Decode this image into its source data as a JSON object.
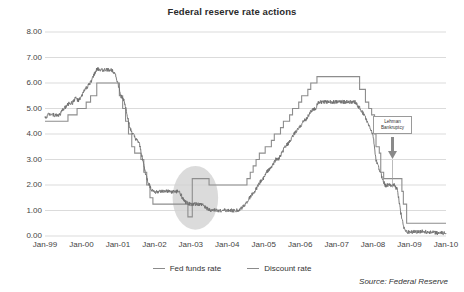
{
  "chart_data": {
    "type": "line",
    "title": "Federal reserve rate actions",
    "xlabel": "",
    "ylabel": "",
    "ylim": [
      0,
      8
    ],
    "ytick_step": 1.0,
    "ytick_labels": [
      "8.00",
      "7.00",
      "6.00",
      "5.00",
      "4.00",
      "3.00",
      "2.00",
      "1.00",
      "0.00"
    ],
    "ytick_values": [
      8,
      7,
      6,
      5,
      4,
      3,
      2,
      1,
      0
    ],
    "xtick_labels": [
      "Jan-99",
      "Jan-00",
      "Jan-01",
      "Jan-02",
      "Jan-03",
      "Jan-04",
      "Jan-05",
      "Jan-06",
      "Jan-07",
      "Jan-08",
      "Jan-09",
      "Jan-10"
    ],
    "xlim": [
      "Jan-99",
      "Jan-10"
    ],
    "grid": "horizontal",
    "legend_position": "bottom-center",
    "source": "Source: Federal Reserve",
    "annotations": [
      {
        "name": "lehman-bankruptcy",
        "line1": "Lehman",
        "line2": "Bankruptcy",
        "x": "Sep-08",
        "arrow": "down"
      }
    ],
    "highlight": {
      "name": "trough-ellipse",
      "x_range": [
        "Jul-02",
        "Oct-03"
      ],
      "y_range": [
        0.6,
        2.4
      ]
    },
    "series": [
      {
        "name": "Fed funds rate",
        "color": "#6f6f6f",
        "points": [
          [
            1999.0,
            4.63
          ],
          [
            1999.08,
            4.76
          ],
          [
            1999.17,
            4.81
          ],
          [
            1999.25,
            4.74
          ],
          [
            1999.33,
            4.74
          ],
          [
            1999.42,
            4.76
          ],
          [
            1999.5,
            4.99
          ],
          [
            1999.58,
            5.07
          ],
          [
            1999.67,
            5.22
          ],
          [
            1999.75,
            5.2
          ],
          [
            1999.83,
            5.42
          ],
          [
            1999.92,
            5.3
          ],
          [
            2000.0,
            5.45
          ],
          [
            2000.08,
            5.73
          ],
          [
            2000.17,
            5.85
          ],
          [
            2000.25,
            6.02
          ],
          [
            2000.33,
            6.27
          ],
          [
            2000.42,
            6.53
          ],
          [
            2000.5,
            6.54
          ],
          [
            2000.58,
            6.5
          ],
          [
            2000.67,
            6.52
          ],
          [
            2000.75,
            6.51
          ],
          [
            2000.83,
            6.51
          ],
          [
            2000.92,
            6.4
          ],
          [
            2001.0,
            5.98
          ],
          [
            2001.08,
            5.49
          ],
          [
            2001.17,
            5.31
          ],
          [
            2001.25,
            4.8
          ],
          [
            2001.33,
            4.21
          ],
          [
            2001.42,
            3.97
          ],
          [
            2001.5,
            3.77
          ],
          [
            2001.58,
            3.65
          ],
          [
            2001.67,
            3.07
          ],
          [
            2001.75,
            2.49
          ],
          [
            2001.83,
            2.09
          ],
          [
            2001.92,
            1.82
          ],
          [
            2002.0,
            1.73
          ],
          [
            2002.17,
            1.74
          ],
          [
            2002.33,
            1.75
          ],
          [
            2002.5,
            1.73
          ],
          [
            2002.67,
            1.75
          ],
          [
            2002.83,
            1.34
          ],
          [
            2003.0,
            1.24
          ],
          [
            2003.17,
            1.25
          ],
          [
            2003.33,
            1.22
          ],
          [
            2003.5,
            1.01
          ],
          [
            2003.67,
            1.01
          ],
          [
            2003.83,
            1.0
          ],
          [
            2004.0,
            1.0
          ],
          [
            2004.17,
            1.0
          ],
          [
            2004.33,
            1.0
          ],
          [
            2004.5,
            1.26
          ],
          [
            2004.58,
            1.43
          ],
          [
            2004.67,
            1.61
          ],
          [
            2004.75,
            1.76
          ],
          [
            2004.83,
            1.93
          ],
          [
            2004.92,
            2.16
          ],
          [
            2005.0,
            2.28
          ],
          [
            2005.08,
            2.5
          ],
          [
            2005.17,
            2.63
          ],
          [
            2005.25,
            2.79
          ],
          [
            2005.33,
            3.0
          ],
          [
            2005.42,
            3.04
          ],
          [
            2005.5,
            3.26
          ],
          [
            2005.58,
            3.5
          ],
          [
            2005.67,
            3.62
          ],
          [
            2005.75,
            3.78
          ],
          [
            2005.83,
            4.0
          ],
          [
            2005.92,
            4.16
          ],
          [
            2006.0,
            4.29
          ],
          [
            2006.08,
            4.49
          ],
          [
            2006.17,
            4.59
          ],
          [
            2006.25,
            4.79
          ],
          [
            2006.33,
            4.94
          ],
          [
            2006.42,
            5.0
          ],
          [
            2006.5,
            5.25
          ],
          [
            2006.58,
            5.25
          ],
          [
            2006.75,
            5.25
          ],
          [
            2007.0,
            5.26
          ],
          [
            2007.25,
            5.26
          ],
          [
            2007.5,
            5.26
          ],
          [
            2007.67,
            4.94
          ],
          [
            2007.75,
            4.76
          ],
          [
            2007.83,
            4.49
          ],
          [
            2007.92,
            4.24
          ],
          [
            2008.0,
            3.94
          ],
          [
            2008.08,
            2.98
          ],
          [
            2008.17,
            2.61
          ],
          [
            2008.25,
            2.28
          ],
          [
            2008.33,
            1.98
          ],
          [
            2008.42,
            2.0
          ],
          [
            2008.5,
            2.01
          ],
          [
            2008.58,
            2.0
          ],
          [
            2008.67,
            1.81
          ],
          [
            2008.75,
            0.97
          ],
          [
            2008.83,
            0.39
          ],
          [
            2008.92,
            0.16
          ],
          [
            2009.0,
            0.15
          ],
          [
            2009.25,
            0.18
          ],
          [
            2009.5,
            0.16
          ],
          [
            2009.75,
            0.12
          ],
          [
            2010.0,
            0.11
          ]
        ]
      },
      {
        "name": "Discount rate",
        "color": "#8d8d8d",
        "points": [
          [
            1999.0,
            4.5
          ],
          [
            1999.5,
            4.5
          ],
          [
            1999.63,
            4.75
          ],
          [
            1999.88,
            5.0
          ],
          [
            2000.0,
            5.0
          ],
          [
            2000.13,
            5.25
          ],
          [
            2000.25,
            5.5
          ],
          [
            2000.42,
            6.0
          ],
          [
            2000.5,
            6.0
          ],
          [
            2001.0,
            6.0
          ],
          [
            2001.04,
            5.5
          ],
          [
            2001.13,
            5.0
          ],
          [
            2001.21,
            4.5
          ],
          [
            2001.29,
            4.0
          ],
          [
            2001.38,
            3.5
          ],
          [
            2001.46,
            3.25
          ],
          [
            2001.63,
            3.0
          ],
          [
            2001.71,
            2.5
          ],
          [
            2001.79,
            2.0
          ],
          [
            2001.88,
            1.5
          ],
          [
            2001.96,
            1.25
          ],
          [
            2002.0,
            1.25
          ],
          [
            2002.88,
            1.25
          ],
          [
            2002.92,
            0.75
          ],
          [
            2003.0,
            0.75
          ],
          [
            2003.04,
            2.25
          ],
          [
            2003.46,
            2.25
          ],
          [
            2003.5,
            2.0
          ],
          [
            2004.0,
            2.0
          ],
          [
            2004.5,
            2.0
          ],
          [
            2004.54,
            2.25
          ],
          [
            2004.63,
            2.5
          ],
          [
            2004.71,
            2.75
          ],
          [
            2004.79,
            3.0
          ],
          [
            2004.88,
            3.25
          ],
          [
            2004.96,
            3.25
          ],
          [
            2005.04,
            3.5
          ],
          [
            2005.21,
            3.75
          ],
          [
            2005.29,
            4.0
          ],
          [
            2005.46,
            4.25
          ],
          [
            2005.54,
            4.5
          ],
          [
            2005.71,
            4.75
          ],
          [
            2005.79,
            5.0
          ],
          [
            2005.96,
            5.25
          ],
          [
            2006.04,
            5.5
          ],
          [
            2006.21,
            5.75
          ],
          [
            2006.29,
            6.0
          ],
          [
            2006.46,
            6.25
          ],
          [
            2006.5,
            6.25
          ],
          [
            2007.0,
            6.25
          ],
          [
            2007.6,
            6.25
          ],
          [
            2007.63,
            5.75
          ],
          [
            2007.79,
            5.25
          ],
          [
            2007.88,
            5.0
          ],
          [
            2007.96,
            4.75
          ],
          [
            2008.04,
            4.0
          ],
          [
            2008.08,
            3.5
          ],
          [
            2008.17,
            3.25
          ],
          [
            2008.21,
            2.5
          ],
          [
            2008.29,
            2.25
          ],
          [
            2008.38,
            2.25
          ],
          [
            2008.71,
            2.25
          ],
          [
            2008.79,
            1.75
          ],
          [
            2008.83,
            1.25
          ],
          [
            2008.92,
            0.5
          ],
          [
            2009.0,
            0.5
          ],
          [
            2009.5,
            0.5
          ],
          [
            2010.0,
            0.5
          ]
        ]
      }
    ]
  }
}
